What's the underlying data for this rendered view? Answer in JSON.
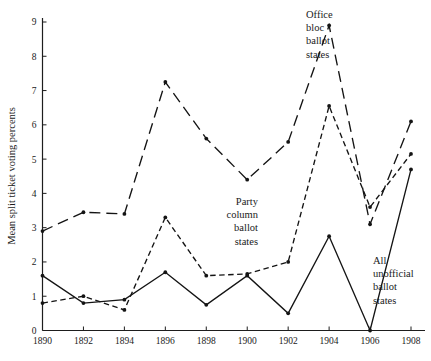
{
  "chart_data": {
    "type": "line",
    "title": "",
    "xlabel": "",
    "ylabel": "Mean split ticket voting percents",
    "x": [
      1890,
      1892,
      1894,
      1896,
      1898,
      1900,
      1902,
      1904,
      1906,
      1908
    ],
    "xtick_labels": [
      "1890",
      "1892",
      "1894",
      "1896",
      "1898",
      "1900",
      "1902",
      "1904",
      "1906",
      "1908"
    ],
    "ytick_labels": [
      "0",
      "1",
      "2",
      "3",
      "4",
      "5",
      "6",
      "7",
      "8",
      "9"
    ],
    "ytick_values": [
      0,
      1,
      2,
      3,
      4,
      5,
      6,
      7,
      8,
      9
    ],
    "xlim": [
      1890,
      1908
    ],
    "ylim": [
      0,
      9
    ],
    "grid": false,
    "legend": "annotations",
    "series": [
      {
        "name": "Office bloc ballot states",
        "style": "long-dash",
        "values": [
          2.9,
          3.45,
          3.4,
          7.25,
          5.6,
          4.4,
          5.5,
          8.9,
          3.1,
          6.1
        ]
      },
      {
        "name": "Party column ballot states",
        "style": "short-dash",
        "values": [
          0.8,
          1.0,
          0.6,
          3.3,
          1.6,
          1.65,
          2.0,
          6.55,
          3.6,
          5.15
        ]
      },
      {
        "name": "All unofficial ballot states",
        "style": "solid",
        "values": [
          1.6,
          0.8,
          0.9,
          1.7,
          0.75,
          1.6,
          0.5,
          2.75,
          0.0,
          4.7
        ]
      }
    ],
    "annotations": [
      {
        "name": "office-bloc-label",
        "text": "Office\nbloc\nballot\nstates",
        "x": 306,
        "y": 18,
        "align": "left"
      },
      {
        "name": "party-column-label",
        "text": "Party\ncolumn\nballot\nstates",
        "x": 258,
        "y": 205,
        "align": "right"
      },
      {
        "name": "all-unofficial-label",
        "text": "All\nunofficial\nballot\nstates",
        "x": 373,
        "y": 264,
        "align": "left"
      }
    ]
  }
}
